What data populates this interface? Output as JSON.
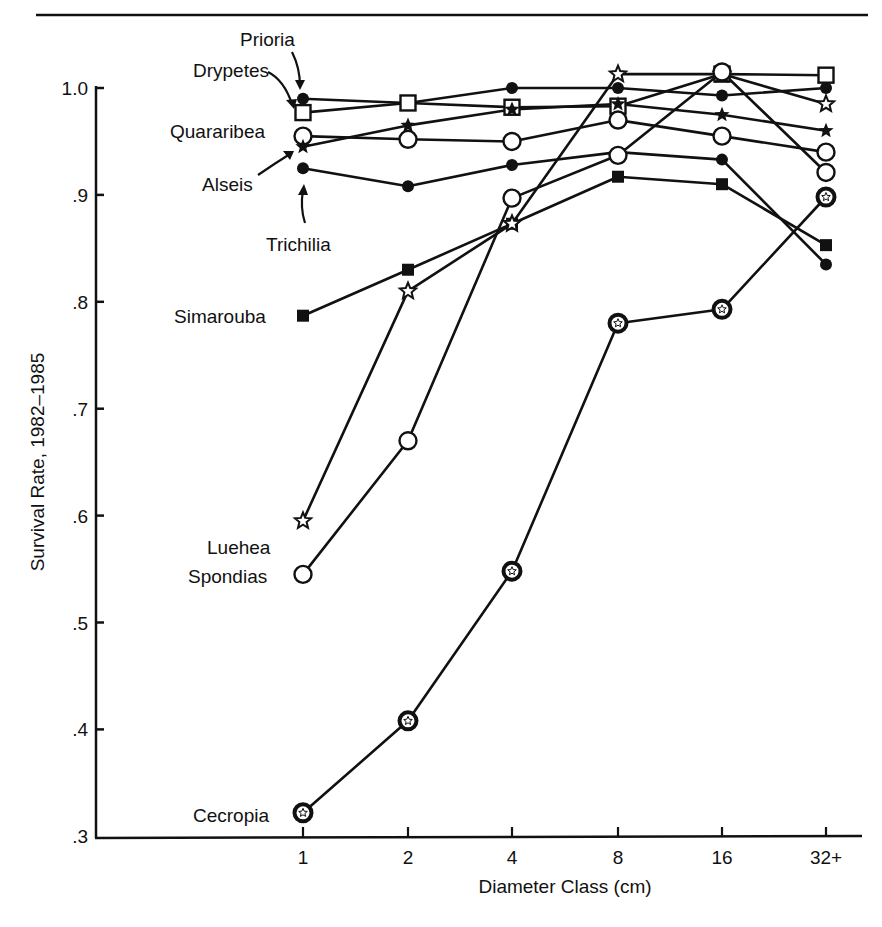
{
  "chart_data": {
    "type": "line",
    "title": "",
    "xlabel": "Diameter Class (cm)",
    "ylabel": "Survival Rate, 1982–1985",
    "categories": [
      "1",
      "2",
      "4",
      "8",
      "16",
      "32+"
    ],
    "ylim": [
      0.3,
      1.0
    ],
    "yticks": [
      "1.0",
      ".9",
      ".8",
      ".7",
      ".6",
      ".5",
      ".4",
      ".3"
    ],
    "ytick_values": [
      1.0,
      0.9,
      0.8,
      0.7,
      0.6,
      0.5,
      0.4,
      0.3
    ],
    "grid": false,
    "legend": "inline labels at left of first data point",
    "series": [
      {
        "name": "Prioria",
        "marker": "filled-circle",
        "values": [
          0.99,
          0.986,
          1.0,
          1.0,
          0.993,
          1.0
        ]
      },
      {
        "name": "Drypetes",
        "marker": "open-square",
        "values": [
          0.977,
          0.986,
          0.982,
          0.983,
          1.013,
          1.012
        ]
      },
      {
        "name": "Quararibea",
        "marker": "open-circle",
        "values": [
          0.955,
          0.952,
          0.95,
          0.97,
          0.955,
          0.94
        ]
      },
      {
        "name": "Alseis",
        "marker": "filled-star",
        "values": [
          0.945,
          0.965,
          0.98,
          0.985,
          0.975,
          0.96
        ]
      },
      {
        "name": "Trichilia",
        "marker": "filled-circle",
        "values": [
          0.925,
          0.908,
          0.928,
          0.94,
          0.933,
          0.835
        ]
      },
      {
        "name": "Simarouba",
        "marker": "filled-square",
        "values": [
          0.787,
          0.83,
          0.873,
          0.917,
          0.91,
          0.853
        ]
      },
      {
        "name": "Luehea",
        "marker": "open-star",
        "values": [
          0.595,
          0.81,
          0.873,
          1.013,
          1.013,
          0.985
        ]
      },
      {
        "name": "Spondias",
        "marker": "open-circle",
        "values": [
          0.545,
          0.67,
          0.897,
          0.937,
          1.015,
          0.921
        ]
      },
      {
        "name": "Cecropia",
        "marker": "open-circle-star",
        "values": [
          0.322,
          0.408,
          0.548,
          0.78,
          0.793,
          0.898
        ]
      }
    ],
    "annotations": [
      {
        "text": "Prioria",
        "arrow": true
      },
      {
        "text": "Drypetes",
        "arrow": true
      },
      {
        "text": "Alseis",
        "arrow": true
      },
      {
        "text": "Trichilia",
        "arrow": true
      }
    ]
  },
  "labels": {
    "Prioria": "Prioria",
    "Drypetes": "Drypetes",
    "Quararibea": "Quararibea",
    "Alseis": "Alseis",
    "Trichilia": "Trichilia",
    "Simarouba": "Simarouba",
    "Luehea": "Luehea",
    "Spondias": "Spondias",
    "Cecropia": "Cecropia"
  }
}
